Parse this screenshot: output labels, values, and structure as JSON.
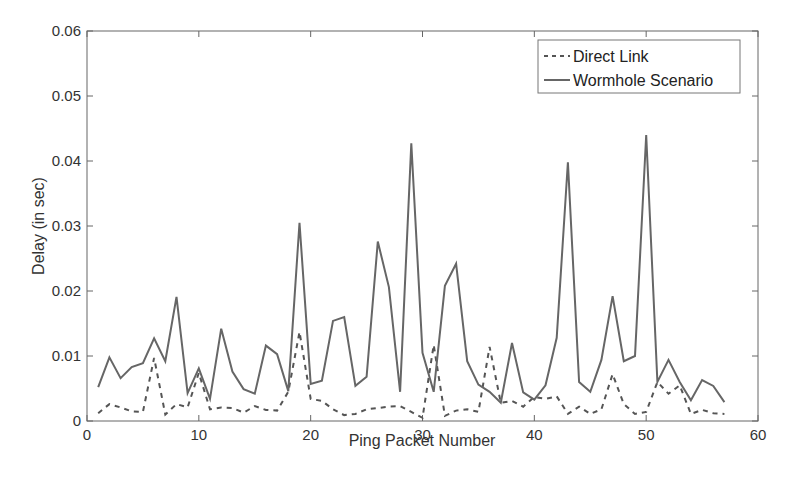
{
  "chart_data": {
    "type": "line",
    "title": "",
    "xlabel": "Ping Packet Number",
    "ylabel": "Delay (in sec)",
    "xlim": [
      0,
      60
    ],
    "ylim": [
      0,
      0.06
    ],
    "xticks": [
      0,
      10,
      20,
      30,
      40,
      50,
      60
    ],
    "xtick_labels": [
      "0",
      "10",
      "20",
      "30",
      "40",
      "50",
      "60"
    ],
    "yticks": [
      0,
      0.01,
      0.02,
      0.03,
      0.04,
      0.05,
      0.06
    ],
    "ytick_labels": [
      "0",
      "0.01",
      "0.02",
      "0.03",
      "0.04",
      "0.05",
      "0.06"
    ],
    "grid": false,
    "legend_position": "upper right",
    "x": [
      1,
      2,
      3,
      4,
      5,
      6,
      7,
      8,
      9,
      10,
      11,
      12,
      13,
      14,
      15,
      16,
      17,
      18,
      19,
      20,
      21,
      22,
      23,
      24,
      25,
      26,
      27,
      28,
      29,
      30,
      31,
      32,
      33,
      34,
      35,
      36,
      37,
      38,
      39,
      40,
      41,
      42,
      43,
      44,
      45,
      46,
      47,
      48,
      49,
      50,
      51,
      52,
      53,
      54,
      55,
      56,
      57
    ],
    "series": [
      {
        "name": "Direct Link",
        "style": "dashed",
        "color": "#555555",
        "values": [
          0.0012,
          0.0026,
          0.0021,
          0.0015,
          0.0014,
          0.0097,
          0.001,
          0.0026,
          0.0021,
          0.0074,
          0.0018,
          0.0021,
          0.002,
          0.0013,
          0.0023,
          0.0017,
          0.0016,
          0.0045,
          0.0137,
          0.0034,
          0.0031,
          0.0018,
          0.0009,
          0.0011,
          0.0018,
          0.002,
          0.0022,
          0.0023,
          0.0014,
          0.0005,
          0.0117,
          0.0008,
          0.0016,
          0.0018,
          0.0014,
          0.0114,
          0.0028,
          0.0031,
          0.0022,
          0.0037,
          0.0034,
          0.0038,
          0.0011,
          0.0022,
          0.0011,
          0.0018,
          0.0072,
          0.0026,
          0.0011,
          0.0014,
          0.006,
          0.0042,
          0.0055,
          0.0011,
          0.0017,
          0.0012,
          0.0011
        ]
      },
      {
        "name": "Wormhole Scenario",
        "style": "solid",
        "color": "#666666",
        "values": [
          0.0052,
          0.0098,
          0.0066,
          0.0083,
          0.0089,
          0.0127,
          0.0092,
          0.0191,
          0.0043,
          0.0081,
          0.0034,
          0.0142,
          0.0076,
          0.0049,
          0.0042,
          0.0116,
          0.0103,
          0.0046,
          0.0305,
          0.0057,
          0.0062,
          0.0154,
          0.016,
          0.0054,
          0.0068,
          0.0276,
          0.0206,
          0.0045,
          0.0427,
          0.0105,
          0.0045,
          0.0208,
          0.0242,
          0.0092,
          0.0056,
          0.0045,
          0.0028,
          0.012,
          0.0044,
          0.0033,
          0.0055,
          0.0128,
          0.0398,
          0.006,
          0.0045,
          0.0094,
          0.0192,
          0.0092,
          0.01,
          0.044,
          0.006,
          0.0094,
          0.006,
          0.0032,
          0.0063,
          0.0054,
          0.0029
        ]
      }
    ]
  },
  "legend": {
    "items": [
      {
        "label": "Direct Link",
        "style": "dashed"
      },
      {
        "label": "Wormhole Scenario",
        "style": "solid"
      }
    ]
  },
  "colors": {
    "axis": "#555555",
    "text": "#333333",
    "direct_line": "#555555",
    "wormhole_line": "#666666"
  }
}
